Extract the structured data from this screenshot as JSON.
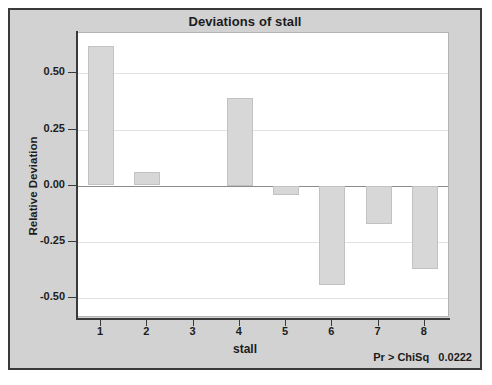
{
  "chart_data": {
    "type": "bar",
    "title": "Deviations of stall",
    "xlabel": "stall",
    "ylabel": "Relative Deviation",
    "categories": [
      "1",
      "2",
      "3",
      "4",
      "5",
      "6",
      "7",
      "8"
    ],
    "values": [
      0.62,
      0.06,
      0.0,
      0.39,
      -0.04,
      -0.44,
      -0.17,
      -0.37
    ],
    "ylim": [
      -0.58,
      0.68
    ],
    "yticks": [
      0.5,
      0.25,
      0.0,
      -0.25,
      -0.5
    ],
    "ytick_labels": [
      "0.50",
      "0.25",
      "0.00",
      "-0.25",
      "-0.50"
    ],
    "grid": true,
    "legend": "none",
    "annotations": [
      {
        "name": "chi-square-p-value",
        "text": "Pr > ChiSq   0.0222",
        "position": "bottom-right-inside-plot"
      }
    ],
    "colors": {
      "bar_fill": "#d7d7d7",
      "bar_border": "#c2c2c2",
      "panel_background": "#d2d2d2",
      "plot_background": "#ffffff",
      "frame_border": "#3a3a3a",
      "gridline": "#e2e2e2",
      "zero_line": "#8c8c8c",
      "text": "#1c1c1c"
    }
  }
}
